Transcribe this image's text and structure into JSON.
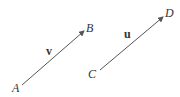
{
  "diagram": {
    "vectors": [
      {
        "name": "v",
        "from": "A",
        "to": "B"
      },
      {
        "name": "u",
        "from": "C",
        "to": "D"
      }
    ],
    "points": {
      "A": "A",
      "B": "B",
      "C": "C",
      "D": "D"
    },
    "color": "#555555"
  }
}
